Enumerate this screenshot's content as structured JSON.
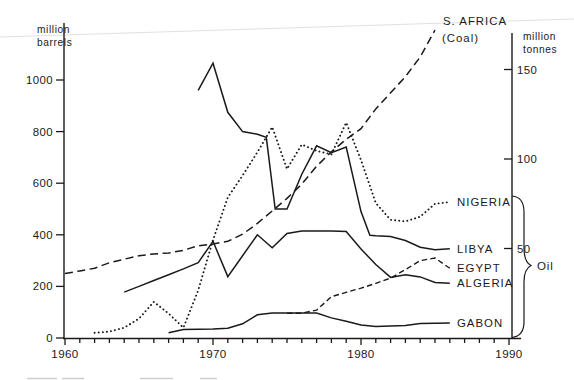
{
  "figure": {
    "left_axis": {
      "unit_lines": [
        "million",
        "barrels"
      ],
      "ticks": [
        0,
        200,
        400,
        600,
        800,
        1000
      ]
    },
    "right_axis": {
      "unit_lines": [
        "million",
        "tonnes"
      ],
      "ticks": [
        50,
        100,
        150
      ]
    },
    "x_axis": {
      "decade_ticks": [
        1960,
        1970,
        1980,
        1990
      ],
      "minor_step_years": 1,
      "range": [
        1960,
        1990
      ]
    },
    "group_label": "Oil",
    "line_color": "#1a1a1a"
  },
  "chart_data": {
    "type": "line",
    "title": "",
    "xlabel": "",
    "ylabel_left": "million barrels",
    "ylabel_right": "million tonnes",
    "x_range": [
      1960,
      1990
    ],
    "ylim_left": [
      0,
      1100
    ],
    "ylim_right": [
      0,
      165
    ],
    "grid": false,
    "legend_position": "right-edge-labels",
    "series": [
      {
        "id": "s_africa_coal",
        "label_lines": [
          "S. AFRICA",
          "(Coal)"
        ],
        "axis": "right",
        "unit": "million tonnes",
        "line_style": "long-dash",
        "points": [
          [
            1960,
            36
          ],
          [
            1961,
            37.5
          ],
          [
            1962,
            39
          ],
          [
            1963,
            42
          ],
          [
            1964,
            44
          ],
          [
            1965,
            46
          ],
          [
            1966,
            47
          ],
          [
            1967,
            47.5
          ],
          [
            1968,
            49
          ],
          [
            1969,
            51.5
          ],
          [
            1970,
            52.5
          ],
          [
            1971,
            54
          ],
          [
            1972,
            58
          ],
          [
            1973,
            64
          ],
          [
            1974,
            71
          ],
          [
            1975,
            78
          ],
          [
            1976,
            86
          ],
          [
            1977,
            96
          ],
          [
            1978,
            104
          ],
          [
            1979,
            111
          ],
          [
            1980,
            117
          ],
          [
            1981,
            128
          ],
          [
            1982,
            137
          ],
          [
            1983,
            146
          ],
          [
            1984,
            157
          ],
          [
            1985,
            172
          ]
        ]
      },
      {
        "id": "nigeria",
        "label_lines": [
          "NIGERIA"
        ],
        "axis": "left",
        "unit": "million barrels",
        "line_style": "dotted",
        "points": [
          [
            1962,
            20
          ],
          [
            1963,
            25
          ],
          [
            1964,
            40
          ],
          [
            1965,
            75
          ],
          [
            1966,
            140
          ],
          [
            1967,
            95
          ],
          [
            1968,
            40
          ],
          [
            1969,
            185
          ],
          [
            1970,
            380
          ],
          [
            1971,
            545
          ],
          [
            1972,
            630
          ],
          [
            1973,
            720
          ],
          [
            1974,
            818
          ],
          [
            1975,
            655
          ],
          [
            1976,
            750
          ],
          [
            1977,
            725
          ],
          [
            1978,
            712
          ],
          [
            1979,
            835
          ],
          [
            1980,
            690
          ],
          [
            1981,
            523
          ],
          [
            1982,
            458
          ],
          [
            1983,
            452
          ],
          [
            1984,
            470
          ],
          [
            1985,
            520
          ],
          [
            1986,
            527
          ]
        ]
      },
      {
        "id": "libya",
        "label_lines": [
          "LIBYA"
        ],
        "axis": "left",
        "unit": "million barrels",
        "line_style": "solid",
        "points": [
          [
            1969,
            960
          ],
          [
            1970,
            1065
          ],
          [
            1971,
            875
          ],
          [
            1972,
            800
          ],
          [
            1973,
            790
          ],
          [
            1973.6,
            778
          ],
          [
            1974.2,
            500
          ],
          [
            1975,
            500
          ],
          [
            1976,
            635
          ],
          [
            1977,
            745
          ],
          [
            1978,
            718
          ],
          [
            1979,
            740
          ],
          [
            1980,
            490
          ],
          [
            1980.6,
            398
          ],
          [
            1981,
            396
          ],
          [
            1982,
            393
          ],
          [
            1983,
            378
          ],
          [
            1984,
            352
          ],
          [
            1985,
            342
          ],
          [
            1986,
            346
          ]
        ]
      },
      {
        "id": "egypt",
        "label_lines": [
          "EGYPT"
        ],
        "axis": "left",
        "unit": "million barrels",
        "line_style": "short-dash",
        "points": [
          [
            1975,
            96
          ],
          [
            1976,
            96
          ],
          [
            1977,
            108
          ],
          [
            1978,
            160
          ],
          [
            1979,
            177
          ],
          [
            1980,
            193
          ],
          [
            1981,
            212
          ],
          [
            1982,
            232
          ],
          [
            1983,
            265
          ],
          [
            1984,
            300
          ],
          [
            1985,
            310
          ],
          [
            1986,
            270
          ]
        ]
      },
      {
        "id": "algeria",
        "label_lines": [
          "ALGERIA"
        ],
        "axis": "left",
        "unit": "million barrels",
        "line_style": "solid",
        "points": [
          [
            1964,
            178
          ],
          [
            1965,
            200
          ],
          [
            1966,
            223
          ],
          [
            1967,
            245
          ],
          [
            1968,
            268
          ],
          [
            1969,
            292
          ],
          [
            1970,
            375
          ],
          [
            1971,
            238
          ],
          [
            1972,
            319
          ],
          [
            1973,
            400
          ],
          [
            1974,
            350
          ],
          [
            1975,
            405
          ],
          [
            1976,
            415
          ],
          [
            1977,
            415
          ],
          [
            1978,
            415
          ],
          [
            1979,
            413
          ],
          [
            1980,
            345
          ],
          [
            1981,
            285
          ],
          [
            1982,
            235
          ],
          [
            1983,
            245
          ],
          [
            1984,
            237
          ],
          [
            1985,
            215
          ],
          [
            1986,
            212
          ]
        ]
      },
      {
        "id": "gabon",
        "label_lines": [
          "GABON"
        ],
        "axis": "left",
        "unit": "million barrels",
        "line_style": "solid",
        "points": [
          [
            1967,
            20
          ],
          [
            1968,
            33
          ],
          [
            1969,
            34
          ],
          [
            1970,
            35
          ],
          [
            1971,
            38
          ],
          [
            1972,
            55
          ],
          [
            1973,
            90
          ],
          [
            1974,
            97
          ],
          [
            1975,
            97
          ],
          [
            1976,
            97
          ],
          [
            1977,
            97
          ],
          [
            1978,
            78
          ],
          [
            1979,
            65
          ],
          [
            1980,
            50
          ],
          [
            1981,
            44
          ],
          [
            1982,
            46
          ],
          [
            1983,
            48
          ],
          [
            1984,
            56
          ],
          [
            1985,
            57
          ],
          [
            1986,
            58
          ]
        ]
      }
    ],
    "oil_group_series": [
      "nigeria",
      "libya",
      "egypt",
      "algeria",
      "gabon"
    ]
  }
}
